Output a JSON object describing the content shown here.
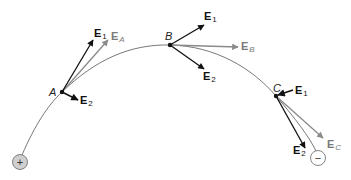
{
  "diagram": {
    "colors": {
      "black_vector": "#111111",
      "gray_vector": "#8a8a8a",
      "field_line": "#555555",
      "positive_charge_fill": "#cfcfcf",
      "negative_charge_fill": "#ffffff"
    },
    "charges": {
      "positive": {
        "symbol": "+",
        "x": 20,
        "y": 162
      },
      "negative": {
        "symbol": "−",
        "x": 318,
        "y": 158
      }
    },
    "points": {
      "A": {
        "label": "A",
        "x": 62,
        "y": 92
      },
      "B": {
        "label": "B",
        "x": 170,
        "y": 45
      },
      "C": {
        "label": "C",
        "x": 276,
        "y": 96
      }
    },
    "vectors": {
      "A": {
        "E1": {
          "main": "E",
          "sub": "1"
        },
        "E2": {
          "main": "E",
          "sub": "2"
        },
        "Enet": {
          "main": "E",
          "sub": "A"
        }
      },
      "B": {
        "E1": {
          "main": "E",
          "sub": "1"
        },
        "E2": {
          "main": "E",
          "sub": "2"
        },
        "Enet": {
          "main": "E",
          "sub": "B"
        }
      },
      "C": {
        "E1": {
          "main": "E",
          "sub": "1"
        },
        "E2": {
          "main": "E",
          "sub": "2"
        },
        "Enet": {
          "main": "E",
          "sub": "C"
        }
      }
    }
  }
}
